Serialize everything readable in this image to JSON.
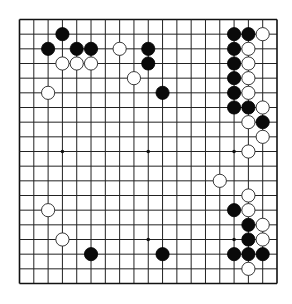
{
  "diagram": {
    "type": "go-board",
    "board_size": 19,
    "colors": {
      "background": "#ffffff",
      "line": "#222222",
      "black_stone": "#0a0a0a",
      "white_stone": "#ffffff"
    },
    "star_points": [
      [
        3,
        3
      ],
      [
        9,
        3
      ],
      [
        15,
        3
      ],
      [
        3,
        9
      ],
      [
        9,
        9
      ],
      [
        15,
        9
      ],
      [
        3,
        15
      ],
      [
        9,
        15
      ],
      [
        15,
        15
      ]
    ],
    "black_stones": [
      [
        3,
        1
      ],
      [
        2,
        2
      ],
      [
        4,
        2
      ],
      [
        5,
        2
      ],
      [
        9,
        2
      ],
      [
        9,
        3
      ],
      [
        10,
        5
      ],
      [
        15,
        1
      ],
      [
        16,
        1
      ],
      [
        15,
        2
      ],
      [
        15,
        3
      ],
      [
        15,
        4
      ],
      [
        15,
        5
      ],
      [
        15,
        6
      ],
      [
        16,
        6
      ],
      [
        17,
        7
      ],
      [
        15,
        13
      ],
      [
        16,
        14
      ],
      [
        16,
        15
      ],
      [
        15,
        16
      ],
      [
        16,
        16
      ],
      [
        17,
        16
      ],
      [
        5,
        16
      ],
      [
        10,
        16
      ]
    ],
    "white_stones": [
      [
        7,
        2
      ],
      [
        3,
        3
      ],
      [
        4,
        3
      ],
      [
        5,
        3
      ],
      [
        8,
        4
      ],
      [
        2,
        5
      ],
      [
        17,
        1
      ],
      [
        16,
        2
      ],
      [
        16,
        3
      ],
      [
        16,
        4
      ],
      [
        16,
        5
      ],
      [
        17,
        6
      ],
      [
        16,
        7
      ],
      [
        17,
        8
      ],
      [
        16,
        9
      ],
      [
        14,
        11
      ],
      [
        16,
        12
      ],
      [
        16,
        13
      ],
      [
        17,
        14
      ],
      [
        17,
        15
      ],
      [
        16,
        17
      ],
      [
        2,
        13
      ],
      [
        3,
        15
      ]
    ]
  }
}
